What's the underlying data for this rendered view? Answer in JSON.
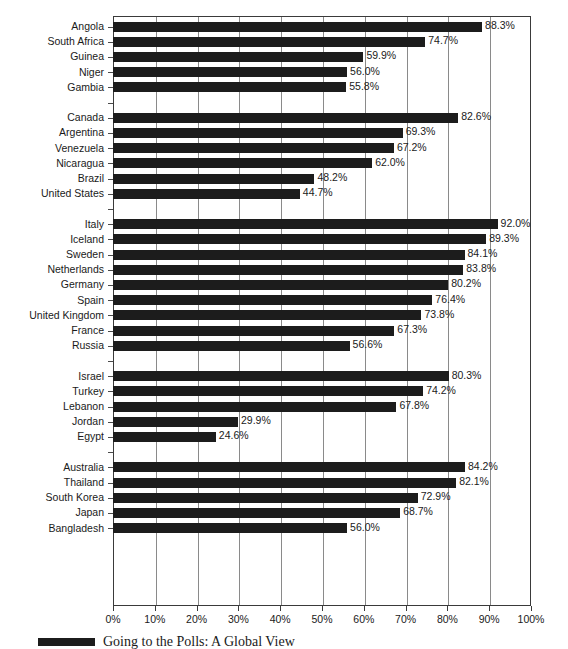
{
  "chart_data": {
    "type": "bar",
    "orientation": "horizontal",
    "title": "",
    "xlabel": "",
    "ylabel": "",
    "xlim": [
      0,
      100
    ],
    "xtick_labels": [
      "0%",
      "10%",
      "20%",
      "30%",
      "40%",
      "50%",
      "60%",
      "70%",
      "80%",
      "90%",
      "100%"
    ],
    "xtick_values": [
      0,
      10,
      20,
      30,
      40,
      50,
      60,
      70,
      80,
      90,
      100
    ],
    "grid": "vertical",
    "legend_position": "bottom-left",
    "legend": [
      "Going to the Polls: A Global View"
    ],
    "value_suffix": "%",
    "groups": [
      {
        "name": "Africa",
        "categories": [
          "Angola",
          "South Africa",
          "Guinea",
          "Niger",
          "Gambia"
        ],
        "values": [
          88.3,
          74.7,
          59.9,
          56.0,
          55.8
        ],
        "labels": [
          "88.3%",
          "74.7%",
          "59.9%",
          "56.0%",
          "55.8%"
        ]
      },
      {
        "name": "Americas",
        "categories": [
          "Canada",
          "Argentina",
          "Venezuela",
          "Nicaragua",
          "Brazil",
          "United States"
        ],
        "values": [
          82.6,
          69.3,
          67.2,
          62.0,
          48.2,
          44.7
        ],
        "labels": [
          "82.6%",
          "69.3%",
          "67.2%",
          "62.0%",
          "48.2%",
          "44.7%"
        ]
      },
      {
        "name": "Europe",
        "categories": [
          "Italy",
          "Iceland",
          "Sweden",
          "Netherlands",
          "Germany",
          "Spain",
          "United Kingdom",
          "France",
          "Russia"
        ],
        "values": [
          92.0,
          89.3,
          84.1,
          83.8,
          80.2,
          76.4,
          73.8,
          67.3,
          56.6
        ],
        "labels": [
          "92.0%",
          "89.3%",
          "84.1%",
          "83.8%",
          "80.2%",
          "76.4%",
          "73.8%",
          "67.3%",
          "56.6%"
        ]
      },
      {
        "name": "Middle East",
        "categories": [
          "Israel",
          "Turkey",
          "Lebanon",
          "Jordan",
          "Egypt"
        ],
        "values": [
          80.3,
          74.2,
          67.8,
          29.9,
          24.6
        ],
        "labels": [
          "80.3%",
          "74.2%",
          "67.8%",
          "29.9%",
          "24.6%"
        ]
      },
      {
        "name": "Asia-Pacific",
        "categories": [
          "Australia",
          "Thailand",
          "South Korea",
          "Japan",
          "Bangladesh"
        ],
        "values": [
          84.2,
          82.1,
          72.9,
          68.7,
          56.0
        ],
        "labels": [
          "84.2%",
          "82.1%",
          "72.9%",
          "68.7%",
          "56.0%"
        ]
      }
    ]
  },
  "colors": {
    "bar": "#1c1c1c",
    "grid": "#8a8a8a",
    "frame": "#3a3a3a",
    "text": "#1a1a1a",
    "background": "#ffffff"
  },
  "legend": {
    "label": "Going to the Polls: A Global View"
  }
}
